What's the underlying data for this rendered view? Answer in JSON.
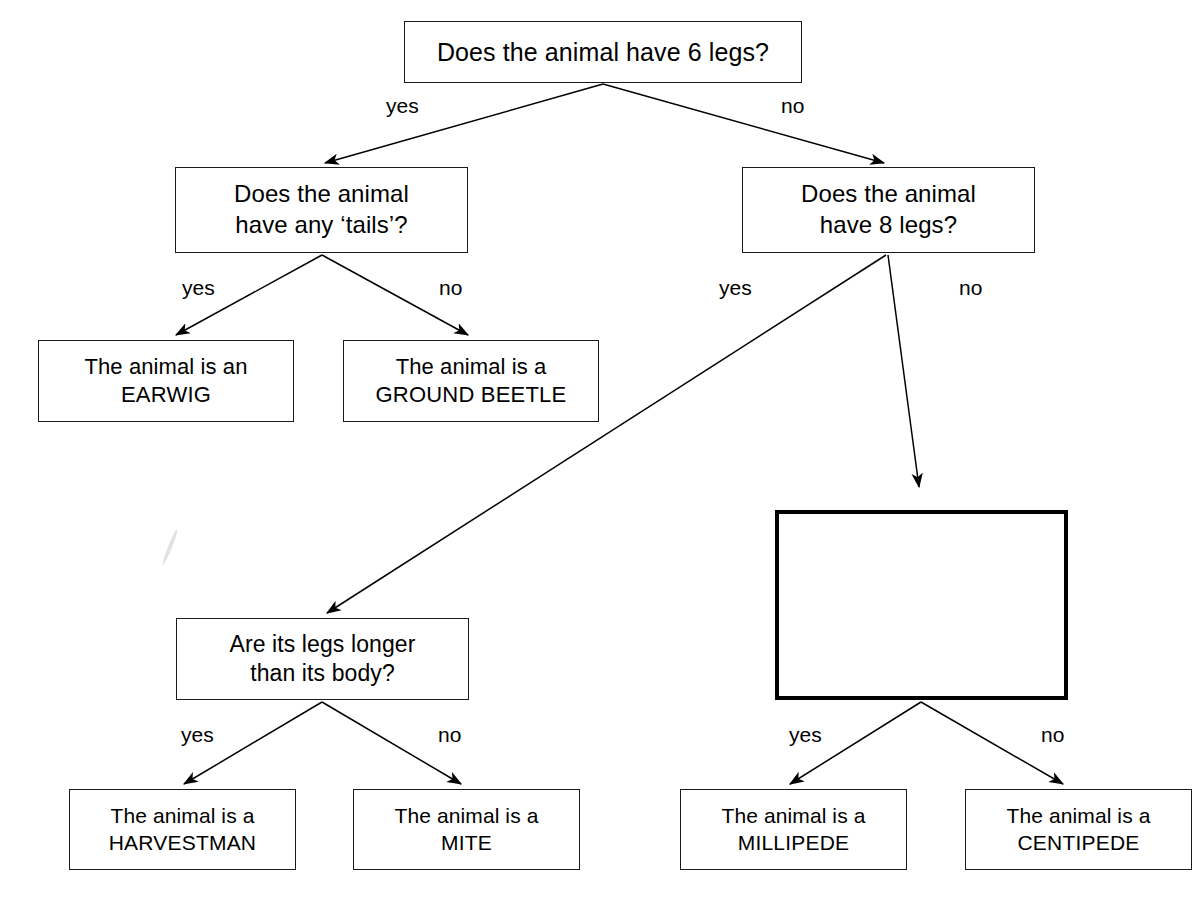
{
  "diagram": {
    "canvas": {
      "width": 1202,
      "height": 909
    },
    "colors": {
      "ink": "#000000",
      "box_border": "#1a1a1a",
      "background": "#ffffff",
      "artifact": "#d8d8d8"
    },
    "nodes": [
      {
        "id": "q-six-legs",
        "kind": "question",
        "emphasis": "normal",
        "lines": [
          "Does the animal have 6 legs?"
        ],
        "box": {
          "x": 404,
          "y": 21,
          "w": 398,
          "h": 62
        },
        "font_size": 25
      },
      {
        "id": "q-tails",
        "kind": "question",
        "emphasis": "normal",
        "lines": [
          "Does the animal",
          "have any ‘tails’?"
        ],
        "box": {
          "x": 175,
          "y": 167,
          "w": 293,
          "h": 86
        },
        "font_size": 24
      },
      {
        "id": "q-eight-legs",
        "kind": "question",
        "emphasis": "normal",
        "lines": [
          "Does the animal",
          "have 8 legs?"
        ],
        "box": {
          "x": 742,
          "y": 167,
          "w": 293,
          "h": 86
        },
        "font_size": 24
      },
      {
        "id": "a-earwig",
        "kind": "answer",
        "emphasis": "normal",
        "lines": [
          "The animal is an",
          "EARWIG"
        ],
        "box": {
          "x": 38,
          "y": 340,
          "w": 256,
          "h": 82
        },
        "font_size": 22
      },
      {
        "id": "a-ground-beetle",
        "kind": "answer",
        "emphasis": "normal",
        "lines": [
          "The animal is a",
          "GROUND BEETLE"
        ],
        "box": {
          "x": 343,
          "y": 340,
          "w": 256,
          "h": 82
        },
        "font_size": 22
      },
      {
        "id": "q-legs-longer",
        "kind": "question",
        "emphasis": "normal",
        "lines": [
          "Are its legs longer",
          "than its body?"
        ],
        "box": {
          "x": 176,
          "y": 618,
          "w": 293,
          "h": 82
        },
        "font_size": 23
      },
      {
        "id": "q-blank",
        "kind": "question",
        "emphasis": "thick",
        "lines": [
          ""
        ],
        "box": {
          "x": 775,
          "y": 510,
          "w": 293,
          "h": 190
        },
        "font_size": 23
      },
      {
        "id": "a-harvestman",
        "kind": "answer",
        "emphasis": "normal",
        "lines": [
          "The animal is a",
          "HARVESTMAN"
        ],
        "box": {
          "x": 69,
          "y": 789,
          "w": 227,
          "h": 81
        },
        "font_size": 21
      },
      {
        "id": "a-mite",
        "kind": "answer",
        "emphasis": "normal",
        "lines": [
          "The animal is a",
          "MITE"
        ],
        "box": {
          "x": 353,
          "y": 789,
          "w": 227,
          "h": 81
        },
        "font_size": 21
      },
      {
        "id": "a-millipede",
        "kind": "answer",
        "emphasis": "normal",
        "lines": [
          "The animal is a",
          "MILLIPEDE"
        ],
        "box": {
          "x": 680,
          "y": 789,
          "w": 227,
          "h": 81
        },
        "font_size": 21
      },
      {
        "id": "a-centipede",
        "kind": "answer",
        "emphasis": "normal",
        "lines": [
          "The animal is a",
          "CENTIPEDE"
        ],
        "box": {
          "x": 965,
          "y": 789,
          "w": 227,
          "h": 81
        },
        "font_size": 21
      }
    ],
    "edges": [
      {
        "id": "e-six-yes",
        "from": "q-six-legs",
        "to": "q-tails",
        "label": "yes",
        "x1": 603,
        "y1": 84,
        "x2": 325,
        "y2": 163,
        "label_x": 386,
        "label_y": 95
      },
      {
        "id": "e-six-no",
        "from": "q-six-legs",
        "to": "q-eight-legs",
        "label": "no",
        "x1": 603,
        "y1": 84,
        "x2": 884,
        "y2": 163,
        "label_x": 781,
        "label_y": 95
      },
      {
        "id": "e-tails-yes",
        "from": "q-tails",
        "to": "a-earwig",
        "label": "yes",
        "x1": 322,
        "y1": 255,
        "x2": 176,
        "y2": 335,
        "label_x": 182,
        "label_y": 277
      },
      {
        "id": "e-tails-no",
        "from": "q-tails",
        "to": "a-ground-beetle",
        "label": "no",
        "x1": 322,
        "y1": 255,
        "x2": 468,
        "y2": 335,
        "label_x": 439,
        "label_y": 277
      },
      {
        "id": "e-eight-yes",
        "from": "q-eight-legs",
        "to": "q-legs-longer",
        "label": "yes",
        "x1": 886,
        "y1": 255,
        "x2": 327,
        "y2": 613,
        "label_x": 719,
        "label_y": 277
      },
      {
        "id": "e-eight-no",
        "from": "q-eight-legs",
        "to": "q-blank",
        "label": "no",
        "x1": 888,
        "y1": 255,
        "x2": 919,
        "y2": 487,
        "label_x": 959,
        "label_y": 277
      },
      {
        "id": "e-legs-yes",
        "from": "q-legs-longer",
        "to": "a-harvestman",
        "label": "yes",
        "x1": 322,
        "y1": 702,
        "x2": 184,
        "y2": 784,
        "label_x": 181,
        "label_y": 724
      },
      {
        "id": "e-legs-no",
        "from": "q-legs-longer",
        "to": "a-mite",
        "label": "no",
        "x1": 322,
        "y1": 702,
        "x2": 461,
        "y2": 784,
        "label_x": 438,
        "label_y": 724
      },
      {
        "id": "e-blank-yes",
        "from": "q-blank",
        "to": "a-millipede",
        "label": "yes",
        "x1": 921,
        "y1": 702,
        "x2": 790,
        "y2": 784,
        "label_x": 789,
        "label_y": 724
      },
      {
        "id": "e-blank-no",
        "from": "q-blank",
        "to": "a-centipede",
        "label": "no",
        "x1": 921,
        "y1": 702,
        "x2": 1063,
        "y2": 784,
        "label_x": 1041,
        "label_y": 724
      }
    ],
    "artifacts": [
      {
        "id": "scan-streak",
        "x": 168,
        "y": 528,
        "w": 4,
        "h": 38,
        "rotate": 22
      }
    ]
  }
}
